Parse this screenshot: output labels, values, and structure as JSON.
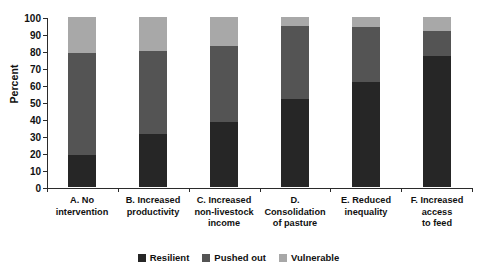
{
  "chart_data": {
    "type": "bar",
    "title": "",
    "subtitle": "",
    "stacked": true,
    "orientation": "vertical",
    "xlabel": "",
    "ylabel": "Percent",
    "ylim": [
      0,
      100
    ],
    "yticks": [
      0,
      10,
      20,
      30,
      40,
      50,
      60,
      70,
      80,
      90,
      100
    ],
    "ytick_labels": [
      "0",
      "10",
      "20",
      "30",
      "40",
      "50",
      "60",
      "70",
      "80",
      "90",
      "100"
    ],
    "grid": false,
    "legend_position": "bottom-center",
    "categories": [
      "A. No intervention",
      "B. Increased productivity",
      "C. Increased non-livestock income",
      "D. Consolidation of pasture",
      "E. Reduced inequality",
      "F. Increased access to feed"
    ],
    "category_lines": [
      [
        "A. No",
        "intervention"
      ],
      [
        "B. Increased",
        "productivity"
      ],
      [
        "C. Increased",
        "non-livestock",
        "income"
      ],
      [
        "D.",
        "Consolidation",
        "of pasture"
      ],
      [
        "E. Reduced",
        "inequality"
      ],
      [
        "F. Increased",
        "access",
        "to feed"
      ]
    ],
    "series": [
      {
        "name": "Resilient",
        "color": "#262626",
        "values": [
          19,
          31,
          38,
          52,
          62,
          77
        ]
      },
      {
        "name": "Pushed out",
        "color": "#545454",
        "values": [
          60,
          49,
          45,
          43,
          32,
          15
        ]
      },
      {
        "name": "Vulnerable",
        "color": "#a8a8a8",
        "values": [
          21,
          20,
          17,
          5,
          6,
          8
        ]
      }
    ],
    "cumulative_tops": {
      "Resilient": [
        19,
        31,
        38,
        52,
        62,
        77
      ],
      "Pushed out": [
        79,
        80,
        83,
        95,
        94,
        92
      ],
      "Vulnerable": [
        100,
        100,
        100,
        100,
        100,
        100
      ]
    }
  },
  "legend": {
    "items": [
      {
        "label": "Resilient",
        "color": "#262626"
      },
      {
        "label": "Pushed out",
        "color": "#545454"
      },
      {
        "label": "Vulnerable",
        "color": "#a8a8a8"
      }
    ]
  },
  "colors": {
    "resilient": "#262626",
    "pushed_out": "#545454",
    "vulnerable": "#a8a8a8",
    "axis": "#2b2b2b",
    "text": "#111111",
    "background": "#ffffff"
  }
}
